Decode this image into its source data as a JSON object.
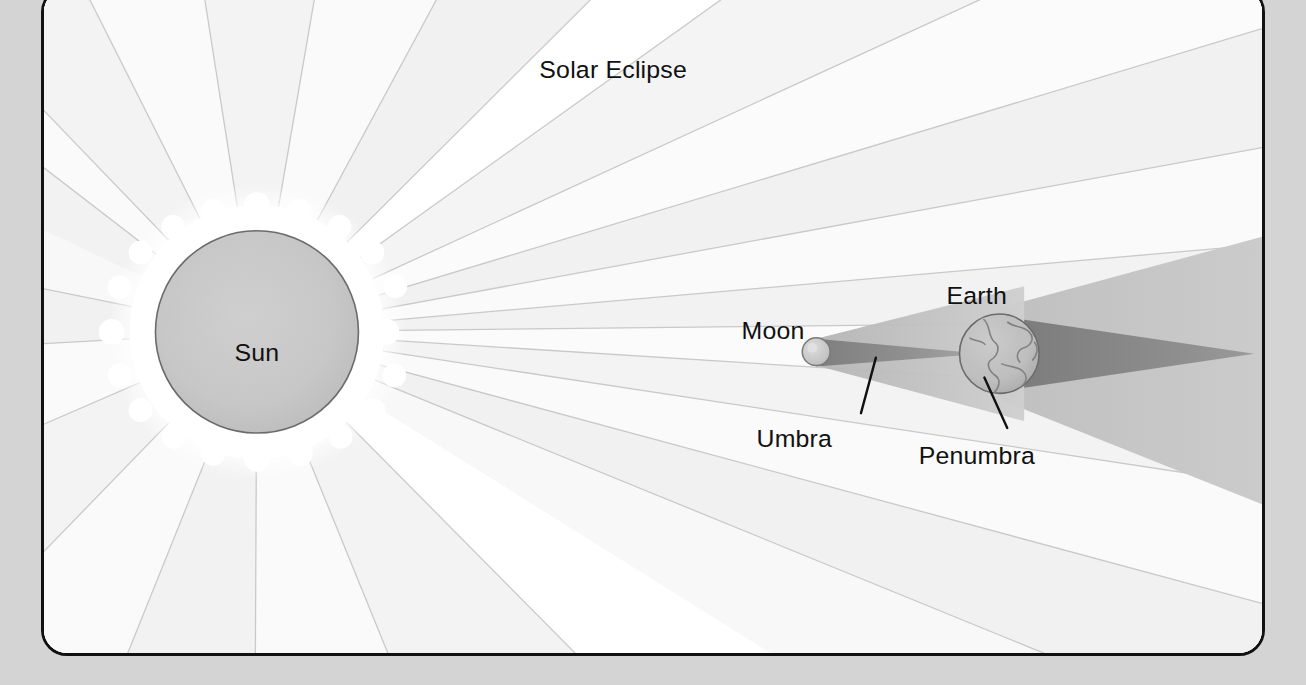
{
  "page": {
    "background_color": "#d4d4d4",
    "panel_background_color": "#ffffff",
    "panel_border_color": "#111111"
  },
  "figure": {
    "title": "Solar Eclipse",
    "type": "astronomy-diagram",
    "ink_colors": {
      "sun_disk": "#c7c7c7",
      "sun_outline": "#5a5a5a",
      "corona": "#ffffff",
      "ray_light": "#f2f2f2",
      "ray_lighter": "#fafafa",
      "ray_line": "#bdbdbd",
      "umbra": "#8c8c8c",
      "penumbra": "#c2c2c2",
      "earth_disk": "#cccccc",
      "earth_outline": "#6e6e6e",
      "moon_disk": "#cfcfcf",
      "label_text": "#111111"
    },
    "labels": [
      {
        "id": "sun",
        "text": "Sun",
        "x": 255,
        "y": 365,
        "anchor": "middle",
        "has_leader": false
      },
      {
        "id": "moon",
        "text": "Moon",
        "x": 742,
        "y": 343,
        "anchor": "start",
        "has_leader": false
      },
      {
        "id": "earth",
        "text": "Earth",
        "x": 948,
        "y": 308,
        "anchor": "start",
        "has_leader": false
      },
      {
        "id": "umbra",
        "text": "Umbra",
        "x": 757,
        "y": 452,
        "anchor": "start",
        "has_leader": true
      },
      {
        "id": "penumbra",
        "text": "Penumbra",
        "x": 920,
        "y": 469,
        "anchor": "start",
        "has_leader": true
      }
    ],
    "bodies": [
      {
        "id": "sun",
        "name": "Sun",
        "cx": 255,
        "cy": 360,
        "r": 102
      },
      {
        "id": "moon",
        "name": "Moon",
        "cx": 776,
        "cy": 366,
        "r": 14
      },
      {
        "id": "earth",
        "name": "Earth",
        "cx": 960,
        "cy": 368,
        "r": 40
      }
    ],
    "shadows": [
      {
        "id": "umbra",
        "name": "Umbra",
        "from": "Moon",
        "to": "Earth",
        "tone": "dark"
      },
      {
        "id": "penumbra",
        "name": "Penumbra",
        "from": "Moon",
        "to": "Earth",
        "tone": "light"
      },
      {
        "id": "earth-umbra",
        "name": "Earth umbra",
        "from": "Earth",
        "to": "space",
        "tone": "dark"
      }
    ]
  }
}
